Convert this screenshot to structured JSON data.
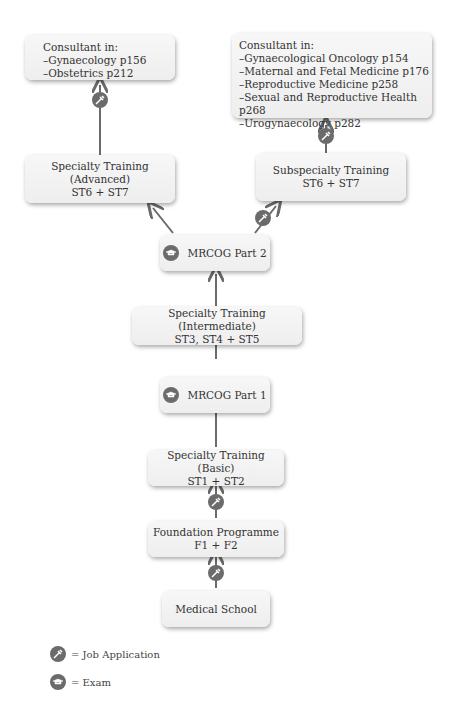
{
  "nodes": {
    "consultant_general": {
      "title": "Consultant in:",
      "items": [
        "–Gynaecology p156",
        "–Obstetrics p212"
      ]
    },
    "consultant_sub": {
      "title": "Consultant in:",
      "items": [
        "–Gynaecological Oncology p154",
        "–Maternal and Fetal Medicine p176",
        "–Reproductive Medicine p258",
        "–Sexual and Reproductive Health p268",
        "–Urogynaecology p282"
      ]
    },
    "st_advanced": {
      "line1": "Specialty Training (Advanced)",
      "line2": "ST6 + ST7"
    },
    "subspecialty": {
      "line1": "Subspecialty Training",
      "line2": "ST6 + ST7"
    },
    "mrcog2": {
      "label": "MRCOG Part 2"
    },
    "st_intermediate": {
      "line1": "Specialty Training (Intermediate)",
      "line2": "ST3, ST4 + ST5"
    },
    "mrcog1": {
      "label": "MRCOG Part 1"
    },
    "st_basic": {
      "line1": "Specialty Training (Basic)",
      "line2": "ST1 + ST2"
    },
    "foundation": {
      "line1": "Foundation Programme",
      "line2": "F1 + F2"
    },
    "medical_school": {
      "label": "Medical School"
    }
  },
  "legend": {
    "job_application": "= Job Application",
    "exam": "= Exam"
  },
  "icons": {
    "job_application": "job-application-icon",
    "exam": "exam-icon"
  },
  "colors": {
    "icon": "#6b6b6b",
    "arrow": "#6b6b6b",
    "box": "#f2f2f2"
  }
}
